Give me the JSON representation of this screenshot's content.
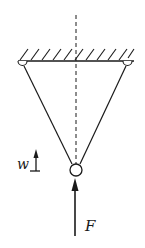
{
  "diagram": {
    "type": "physics-free-body",
    "labels": {
      "force": "F",
      "weight": "w"
    },
    "colors": {
      "stroke": "#1a1a1a",
      "background": "#ffffff"
    }
  }
}
